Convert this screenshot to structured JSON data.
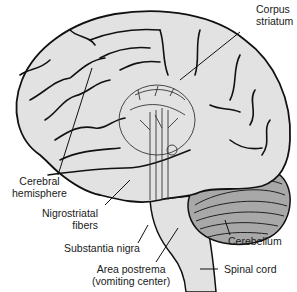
{
  "diagram": {
    "colors": {
      "fill": "#e2e2e2",
      "outline": "#111111",
      "cerebellum": "#a8a8a8",
      "text": "#1a1a1a"
    },
    "labels": {
      "corpus_striatum": {
        "line1": "Corpus",
        "line2": "striatum"
      },
      "cerebral_hemisphere": {
        "line1": "Cerebral",
        "line2": "hemisphere"
      },
      "nigrostriatal_fibers": {
        "line1": "Nigrostriatal",
        "line2": "fibers"
      },
      "substantia_nigra": "Substantia nigra",
      "cerebellum": "Cerebellum",
      "area_postrema": {
        "line1": "Area postrema",
        "line2": "(vomiting center)"
      },
      "spinal_cord": "Spinal cord"
    }
  }
}
